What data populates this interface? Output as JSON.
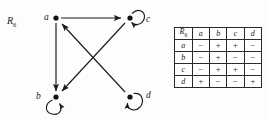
{
  "diagram": {
    "relation_name": "R",
    "relation_subscript": "6",
    "nodes": [
      {
        "id": "a",
        "label": "a",
        "x": 56,
        "y": 18,
        "self_loop": false,
        "label_x": 44,
        "label_y": 13
      },
      {
        "id": "c",
        "label": "c",
        "x": 130,
        "y": 18,
        "self_loop": true,
        "label_x": 146,
        "label_y": 15
      },
      {
        "id": "b",
        "label": "b",
        "x": 56,
        "y": 97,
        "self_loop": true,
        "label_x": 36,
        "label_y": 92
      },
      {
        "id": "d",
        "label": "d",
        "x": 130,
        "y": 97,
        "self_loop": true,
        "label_x": 146,
        "label_y": 91
      }
    ],
    "edges": [
      {
        "from": "a",
        "to": "c",
        "kind": "straight"
      },
      {
        "from": "a",
        "to": "b",
        "kind": "straight"
      },
      {
        "from": "c",
        "to": "b",
        "kind": "straight"
      },
      {
        "from": "d",
        "to": "a",
        "kind": "straight"
      },
      {
        "from": "b",
        "to": "b",
        "kind": "self-loop"
      },
      {
        "from": "c",
        "to": "c",
        "kind": "self-loop"
      },
      {
        "from": "d",
        "to": "d",
        "kind": "self-loop"
      }
    ],
    "stroke_color": "#1a1a1a",
    "node_fill": "#111111"
  },
  "matrix": {
    "corner_label": "R",
    "corner_subscript": "6",
    "columns": [
      "a",
      "b",
      "c",
      "d"
    ],
    "rows": [
      {
        "header": "a",
        "values": [
          "−",
          "+",
          "+",
          "−"
        ]
      },
      {
        "header": "b",
        "values": [
          "−",
          "+",
          "−",
          "−"
        ]
      },
      {
        "header": "c",
        "values": [
          "−",
          "+",
          "+",
          "−"
        ]
      },
      {
        "header": "d",
        "values": [
          "+",
          "−",
          "−",
          "+"
        ]
      }
    ],
    "border_color": "#2a2a2a"
  }
}
